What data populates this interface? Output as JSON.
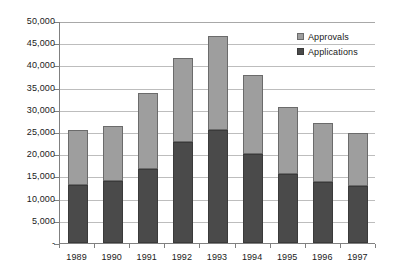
{
  "chart_data": {
    "type": "bar",
    "stacked": true,
    "title": "",
    "subtitle": "",
    "xlabel": "",
    "ylabel": "",
    "categories": [
      "1989",
      "1990",
      "1991",
      "1992",
      "1993",
      "1994",
      "1995",
      "1996",
      "1997"
    ],
    "series": [
      {
        "name": "Applications",
        "color": "#4a4a4a",
        "values": [
          13000,
          14000,
          16600,
          22700,
          25400,
          20000,
          15500,
          13700,
          12800
        ]
      },
      {
        "name": "Approvals",
        "color": "#9e9e9e",
        "values": [
          12400,
          12400,
          17200,
          19000,
          21300,
          17900,
          15200,
          13400,
          12000
        ]
      }
    ],
    "totals": [
      25400,
      26400,
      33800,
      41700,
      46700,
      37900,
      30700,
      27100,
      24800
    ],
    "ylim": [
      0,
      50000
    ],
    "ytick_values": [
      0,
      5000,
      10000,
      15000,
      20000,
      25000,
      30000,
      35000,
      40000,
      45000,
      50000
    ],
    "ytick_labels": [
      "-",
      "5,000",
      "10,000",
      "15,000",
      "20,000",
      "25,000",
      "30,000",
      "35,000",
      "40,000",
      "45,000",
      "50,000"
    ],
    "grid": true,
    "grid_axis": "y",
    "legend_position": "top-right",
    "legend_entries": [
      "Approvals",
      "Applications"
    ],
    "stack_order_bottom_to_top": [
      "Applications",
      "Approvals"
    ]
  },
  "legend": {
    "items": [
      {
        "label": "Approvals",
        "swatch_class": "sw-approvals"
      },
      {
        "label": "Applications",
        "swatch_class": "sw-applications"
      }
    ]
  },
  "colors": {
    "approvals": "#9e9e9e",
    "applications": "#4a4a4a",
    "gridline": "#bdbdbd",
    "axis": "#808080",
    "background": "#ffffff",
    "text": "#1a1a1a"
  }
}
